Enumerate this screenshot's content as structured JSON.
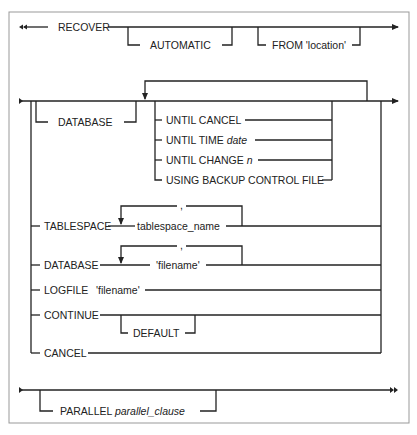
{
  "diagram": {
    "type": "railroad-syntax",
    "statement": "RECOVER",
    "line1": {
      "keyword": "RECOVER",
      "optional": [
        "AUTOMATIC",
        "FROM 'location'"
      ]
    },
    "line2": {
      "database_branch": "DATABASE",
      "repeat_options": [
        {
          "text": "UNTIL CANCEL",
          "italic": ""
        },
        {
          "text": "UNTIL TIME ",
          "italic": "date"
        },
        {
          "text": "UNTIL CHANGE ",
          "italic": "n"
        },
        {
          "text": "USING BACKUP CONTROL FILE",
          "italic": ""
        }
      ],
      "alternatives": {
        "tablespace": {
          "keyword": "TABLESPACE",
          "item": "tablespace_name",
          "separator": ","
        },
        "datafile": {
          "keyword": "DATABASE",
          "item": "'filename'",
          "separator": ","
        },
        "logfile": {
          "keyword": "LOGFILE",
          "item": "'filename'"
        },
        "continue": {
          "keyword": "CONTINUE",
          "optional": "DEFAULT"
        },
        "cancel": {
          "keyword": "CANCEL"
        }
      }
    },
    "line3": {
      "keyword": "PARALLEL ",
      "italic": "parallel_clause"
    }
  }
}
